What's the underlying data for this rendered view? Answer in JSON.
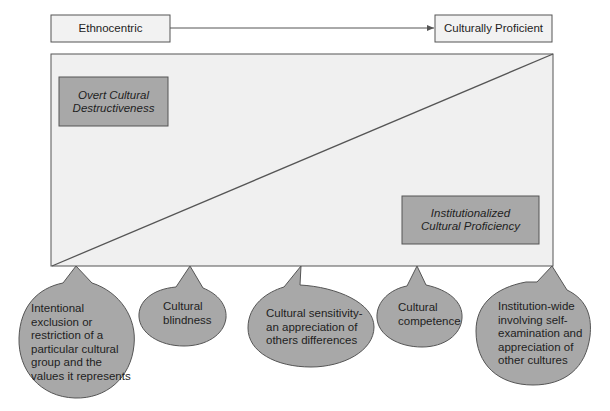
{
  "diagram": {
    "type": "cultural-proficiency-continuum",
    "axis": {
      "start_label": "Ethnocentric",
      "end_label": "Culturally Proficient",
      "direction": "left-to-right arrow"
    },
    "main_panel": {
      "top_left_box": "Overt Cultural Destructiveness",
      "top_left_box_line1": "Overt Cultural",
      "top_left_box_line2": "Destructiveness",
      "bottom_right_box": "Institutionalized Cultural Proficiency",
      "bottom_right_box_line1": "Institutionalized",
      "bottom_right_box_line2": "Cultural Proficiency",
      "divider": "diagonal from bottom-left to top-right"
    },
    "bubbles": [
      {
        "text": "Intentional exclusion or restriction of a particular cultural group and the values it represents",
        "lines": [
          "Intentional",
          "exclusion or",
          "restriction of a",
          "particular cultural",
          "group and the",
          "values it represents"
        ]
      },
      {
        "text": "Cultural blindness",
        "lines": [
          "Cultural",
          "blindness"
        ]
      },
      {
        "text": "Cultural sensitivity- an appreciation of others differences",
        "lines": [
          "Cultural sensitivity-",
          "an appreciation of",
          "others differences"
        ]
      },
      {
        "text": "Cultural competence",
        "lines": [
          "Cultural",
          "competence"
        ]
      },
      {
        "text": "Institution-wide involving self-examination and appreciation of other cultures",
        "lines": [
          "Institution-wide",
          "involving self-",
          "examination and",
          "appreciation of",
          "other cultures"
        ]
      }
    ]
  },
  "colors": {
    "panel_fill": "#f0f0f0",
    "box_fill": "#a8a8a8",
    "bubble_fill": "#a8a8a8",
    "stroke": "#555555"
  }
}
